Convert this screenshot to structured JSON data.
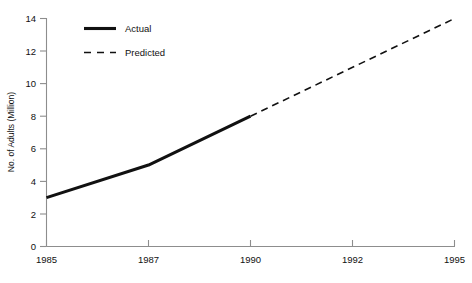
{
  "chart_data": {
    "type": "line",
    "title": "",
    "xlabel": "",
    "ylabel": "No. of Adults (Million)",
    "x": [
      "1985",
      "1987",
      "1990",
      "1992",
      "1995"
    ],
    "xtick_labels": [
      "1985",
      "1987",
      "1990",
      "1992",
      "1995"
    ],
    "ytick_labels": [
      "0",
      "2",
      "4",
      "6",
      "8",
      "10",
      "12",
      "14"
    ],
    "ylim": [
      0,
      14
    ],
    "ytick_step": 2,
    "grid": false,
    "legend_position": "upper-left",
    "series": [
      {
        "name": "Actual",
        "style": "solid",
        "color": "#111111",
        "points": [
          {
            "x": "1985",
            "y": 3
          },
          {
            "x": "1987",
            "y": 5
          },
          {
            "x": "1990",
            "y": 8
          }
        ]
      },
      {
        "name": "Predicted",
        "style": "dashed",
        "color": "#111111",
        "points": [
          {
            "x": "1990",
            "y": 8
          },
          {
            "x": "1995",
            "y": 14
          }
        ]
      }
    ],
    "legend": [
      {
        "label": "Actual",
        "style": "solid"
      },
      {
        "label": "Predicted",
        "style": "dashed"
      }
    ]
  },
  "axis": {
    "y_title": "No. of Adults (Million)",
    "y_ticks": [
      "14",
      "12",
      "10",
      "8",
      "6",
      "4",
      "2",
      "0"
    ],
    "x_ticks": [
      "1985",
      "1987",
      "1990",
      "1992",
      "1995"
    ]
  },
  "legend": {
    "actual_label": "Actual",
    "predicted_label": "Predicted"
  },
  "colors": {
    "axis": "#8d8d8d",
    "line": "#111111",
    "background": "#ffffff",
    "text": "#111111"
  }
}
